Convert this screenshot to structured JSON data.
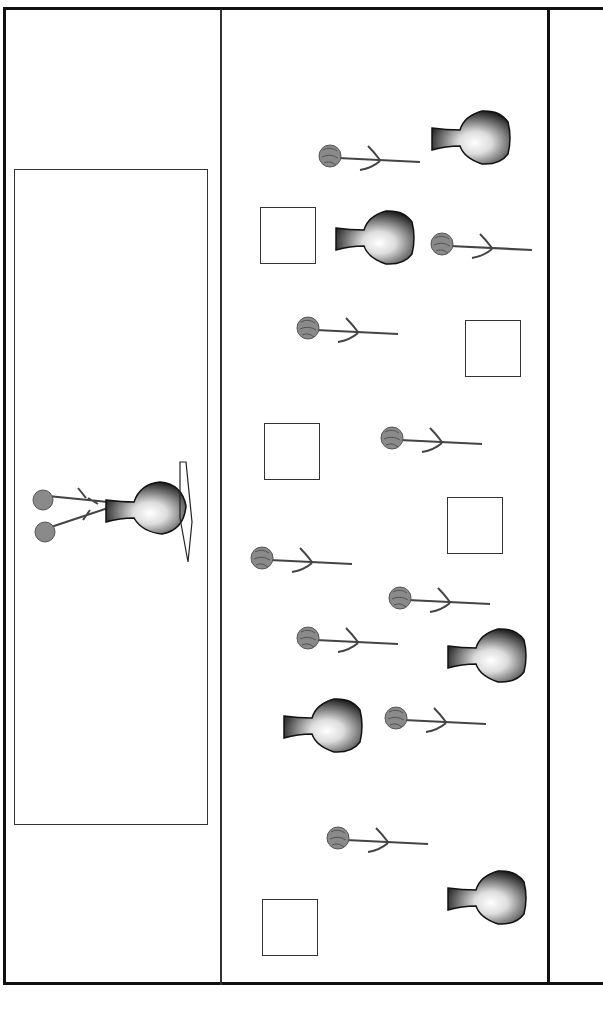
{
  "scene": {
    "description": "Counting worksheet: vases and carnations",
    "colors": {
      "line": "#222222",
      "flower": "#888888",
      "vase_dark": "#222222"
    },
    "left_panel": {
      "box": {
        "x": 14,
        "y": 169,
        "w": 194,
        "h": 656
      },
      "example": {
        "x": 28,
        "y": 458
      }
    },
    "flowers": [
      {
        "x": 318,
        "y": 138
      },
      {
        "x": 430,
        "y": 226
      },
      {
        "x": 296,
        "y": 310
      },
      {
        "x": 380,
        "y": 420
      },
      {
        "x": 250,
        "y": 540
      },
      {
        "x": 388,
        "y": 580
      },
      {
        "x": 296,
        "y": 620
      },
      {
        "x": 384,
        "y": 700
      },
      {
        "x": 326,
        "y": 820
      }
    ],
    "vases": [
      {
        "x": 430,
        "y": 108
      },
      {
        "x": 334,
        "y": 208
      },
      {
        "x": 446,
        "y": 626
      },
      {
        "x": 282,
        "y": 696
      },
      {
        "x": 446,
        "y": 868
      }
    ],
    "squares": [
      {
        "x": 260,
        "y": 207
      },
      {
        "x": 465,
        "y": 320
      },
      {
        "x": 264,
        "y": 423
      },
      {
        "x": 447,
        "y": 497
      },
      {
        "x": 262,
        "y": 899
      }
    ]
  }
}
